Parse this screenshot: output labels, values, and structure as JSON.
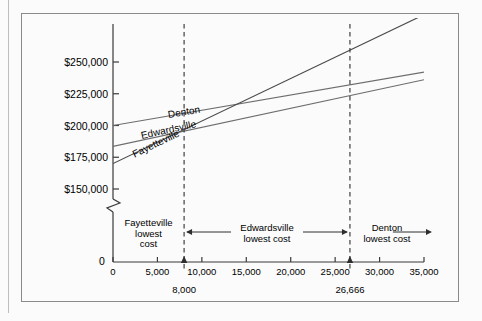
{
  "figure": {
    "top_cut_text": "",
    "background": "#fbfbfb",
    "frame_color": "#8a8a8a"
  },
  "chart_data": {
    "type": "line",
    "title": "",
    "subtitle": "",
    "xlabel": "",
    "ylabel": "",
    "grid": false,
    "legend_position": "inline-on-line",
    "axis_break": true,
    "axis_break_note": "y-axis broken between 0 and $150,000",
    "xlim": [
      0,
      35000
    ],
    "ylim": [
      150000,
      262500
    ],
    "y_ticks": [
      150000,
      175000,
      200000,
      225000,
      250000
    ],
    "y_tick_labels": [
      "$150,000",
      "$175,000",
      "$200,000",
      "$225,000",
      "$250,000"
    ],
    "y_origin_label": "0",
    "x_ticks": [
      0,
      5000,
      10000,
      15000,
      20000,
      25000,
      30000,
      35000
    ],
    "x_tick_labels": [
      "0",
      "5,000",
      "10,000",
      "15,000",
      "20,000",
      "25,000",
      "30,000",
      "35,000"
    ],
    "series": [
      {
        "name": "Denton",
        "color": "#6d6d6d",
        "fixed_cost": 200000,
        "variable_cost_per_unit": 1.2,
        "x": [
          0,
          35000
        ],
        "values": [
          200000,
          242000
        ],
        "label_x": 6200,
        "label_y": 208000
      },
      {
        "name": "Edwardsville",
        "color": "#6d6d6d",
        "fixed_cost": 183500,
        "variable_cost_per_unit": 1.5,
        "x": [
          0,
          35000
        ],
        "values": [
          183500,
          236000
        ],
        "label_x": 3200,
        "label_y": 192000
      },
      {
        "name": "Fayetteville",
        "color": "#4a4a4a",
        "fixed_cost": 170000,
        "variable_cost_per_unit": 3.35,
        "x": [
          0,
          35000
        ],
        "values": [
          170000,
          287250
        ],
        "label_x": 2200,
        "label_y": 177000
      }
    ],
    "breakeven_points": [
      {
        "label": "8,000",
        "x": 8000
      },
      {
        "label": "26,666",
        "x": 26666
      }
    ],
    "regions": [
      {
        "id": "fayetteville-region",
        "line1": "Fayetteville",
        "line2": "lowest",
        "line3": "cost",
        "x_start": 0,
        "x_end": 8000
      },
      {
        "id": "edwardsville-region",
        "line1": "Edwardsville",
        "line2": "lowest cost",
        "line3": "",
        "x_start": 8000,
        "x_end": 26666
      },
      {
        "id": "denton-region",
        "line1": "Denton",
        "line2": "lowest cost",
        "line3": "",
        "x_start": 26666,
        "x_end": 35000
      }
    ]
  }
}
